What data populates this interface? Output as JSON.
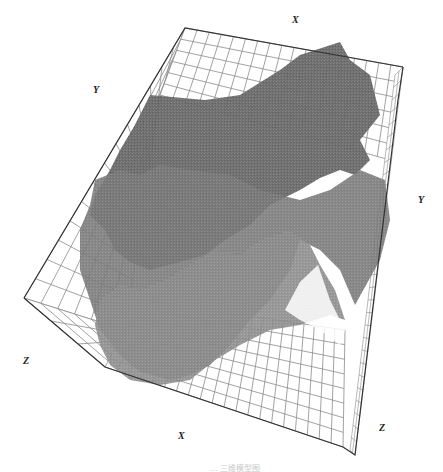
{
  "figure": {
    "type": "3d-wireframe-surface-model",
    "axis_labels": {
      "x_top": "X",
      "y_left": "Y",
      "y_right": "Y",
      "z_left": "Z",
      "x_bottom": "X",
      "z_right": "Z"
    },
    "caption": "… 三维模型图",
    "colors": {
      "grid_line": "#888888",
      "box_edge": "#333333",
      "surface_dark": "#666666",
      "surface_mid": "#7a7a7a",
      "surface_light": "#8e8e8e",
      "background": "#ffffff"
    },
    "layers": [
      {
        "name": "upper-surface",
        "shade": "dark"
      },
      {
        "name": "middle-surface",
        "shade": "mid"
      },
      {
        "name": "lower-surface",
        "shade": "light"
      }
    ]
  }
}
